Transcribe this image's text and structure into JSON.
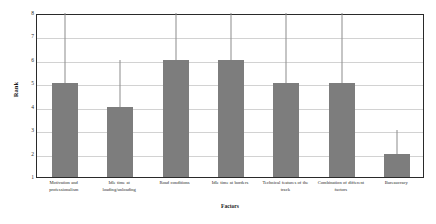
{
  "chart_data": {
    "type": "bar",
    "title": "",
    "xlabel": "Factors",
    "ylabel": "Rank",
    "categories": [
      "Motivation and professionalism",
      "Idle time at loading/unloading",
      "Road conditions",
      "Idle time at borders",
      "Technical features of the track",
      "Combination of different factors",
      "Bureaucracy"
    ],
    "values": [
      5,
      4,
      6,
      6,
      5,
      5,
      2
    ],
    "error_high": [
      8,
      6,
      8,
      8,
      8,
      8,
      3
    ],
    "ylim": [
      1,
      8
    ],
    "yticks": [
      1,
      2,
      3,
      4,
      5,
      6,
      7,
      8
    ],
    "ytick_labels": [
      "1",
      "2",
      "3",
      "4",
      "5",
      "6",
      "7",
      "8"
    ],
    "grid": true,
    "legend": false,
    "bar_color": "#7d7d7d",
    "grid_color": "#d2d2d2",
    "axis_color": "#2a2a2a"
  }
}
